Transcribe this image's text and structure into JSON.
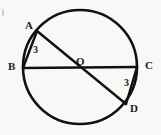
{
  "figure": {
    "kind": "circle-with-two-diameters",
    "background_color": "#f8f8f6",
    "stroke_color": "#111111",
    "label_color": "#1a1a1a",
    "artifact_mark": ")",
    "circle": {
      "center_label": "O",
      "cx": 80,
      "cy": 67,
      "r": 57,
      "stroke_width": 2.6
    },
    "points": [
      {
        "id": "A",
        "label": "A",
        "x": 37,
        "y": 31,
        "position": "upper-left"
      },
      {
        "id": "B",
        "label": "B",
        "x": 23,
        "y": 68,
        "position": "left"
      },
      {
        "id": "C",
        "label": "C",
        "x": 137,
        "y": 67,
        "position": "right"
      },
      {
        "id": "D",
        "label": "D",
        "x": 126,
        "y": 104,
        "position": "lower-right"
      },
      {
        "id": "O",
        "label": "O",
        "x": 80,
        "y": 67,
        "position": "center"
      }
    ],
    "segments": [
      {
        "id": "BC",
        "from": "B",
        "to": "C",
        "type": "diameter",
        "length_label": ""
      },
      {
        "id": "AD",
        "from": "A",
        "to": "D",
        "type": "diameter",
        "length_label": ""
      },
      {
        "id": "AB",
        "from": "A",
        "to": "B",
        "type": "chord",
        "length_label": "3"
      },
      {
        "id": "CD",
        "from": "C",
        "to": "D",
        "type": "chord",
        "length_label": "3"
      }
    ],
    "length_labels": {
      "ab": "3",
      "cd": "3"
    },
    "center_dot": false
  }
}
